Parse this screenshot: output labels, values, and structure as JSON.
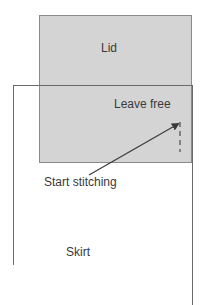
{
  "diagram": {
    "lid": {
      "label": "Lid",
      "fill": "#d4d4d4",
      "border": "#8a8a8a"
    },
    "leave_free": {
      "label": "Leave free"
    },
    "start_stitching": {
      "label": "Start stitching"
    },
    "skirt": {
      "label": "Skirt"
    },
    "arrow": {
      "from": [
        89,
        175
      ],
      "to": [
        181,
        123
      ],
      "color": "#3a3a3a"
    },
    "stitch_line": {
      "x": 180,
      "y1": 122,
      "y2": 152,
      "style": "dashed"
    }
  }
}
